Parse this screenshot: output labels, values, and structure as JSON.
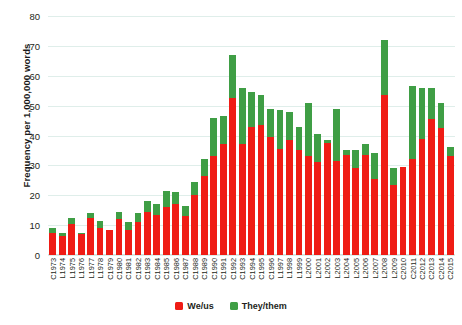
{
  "chart_data": {
    "type": "bar",
    "stacked": true,
    "title": "",
    "xlabel": "",
    "ylabel": "Frequency per 1,000,000 words",
    "ylim": [
      0,
      80
    ],
    "yticks": [
      0,
      10,
      20,
      30,
      40,
      50,
      60,
      70,
      80
    ],
    "grid": true,
    "legend_position": "bottom-center",
    "categories": [
      "C1973",
      "L1974",
      "L1975",
      "L1976",
      "L1977",
      "L1978",
      "C1979",
      "C1980",
      "C1981",
      "C1982",
      "C1983",
      "C1984",
      "C1985",
      "C1986",
      "C1987",
      "C1988",
      "C1989",
      "C1990",
      "C1991",
      "C1992",
      "C1993",
      "C1994",
      "C1995",
      "C1996",
      "L1997",
      "L1998",
      "L1999",
      "L2000",
      "L2001",
      "L2002",
      "L2003",
      "L2004",
      "L2005",
      "L2006",
      "L2007",
      "L2008",
      "L2009",
      "C2010",
      "C2011",
      "C2012",
      "C2013",
      "C2014",
      "C2015"
    ],
    "series": [
      {
        "name": "We/us",
        "color": "#ef1c15",
        "values": [
          7.5,
          6.5,
          10.5,
          7.0,
          12.5,
          9.0,
          8.5,
          12.0,
          8.5,
          11.0,
          14.5,
          13.5,
          16.0,
          17.0,
          13.0,
          20.0,
          26.5,
          33.0,
          37.0,
          52.5,
          37.0,
          43.0,
          43.5,
          39.5,
          35.5,
          38.5,
          35.0,
          33.0,
          31.0,
          37.5,
          31.5,
          33.5,
          29.0,
          33.5,
          25.5,
          53.5,
          23.5,
          29.5,
          32.0,
          39.0,
          45.5,
          42.5,
          33.0
        ]
      },
      {
        "name": "They/them",
        "color": "#3f9e45",
        "values": [
          1.5,
          1.0,
          2.0,
          0.5,
          1.5,
          2.5,
          0.0,
          2.5,
          2.5,
          3.0,
          3.5,
          3.5,
          5.5,
          4.0,
          3.5,
          4.5,
          5.5,
          13.0,
          9.5,
          14.5,
          19.0,
          11.5,
          10.0,
          9.5,
          13.0,
          9.5,
          8.0,
          18.0,
          9.5,
          1.0,
          17.5,
          1.5,
          6.0,
          3.5,
          8.5,
          18.5,
          5.5,
          0.0,
          24.5,
          17.0,
          10.5,
          8.5,
          3.0
        ]
      }
    ]
  },
  "legend": {
    "items": [
      {
        "label": "We/us",
        "color": "#ef1c15"
      },
      {
        "label": "They/them",
        "color": "#3f9e45"
      }
    ]
  }
}
